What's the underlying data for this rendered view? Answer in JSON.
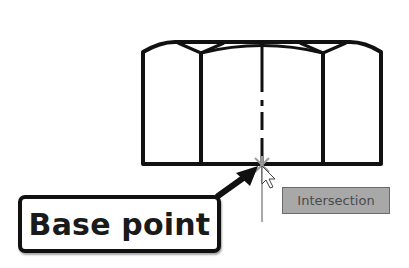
{
  "diagram": {
    "type": "cad-object-snap",
    "shape": "hex-nut-side-view",
    "callout": {
      "label": "Base point"
    },
    "snap_tooltip": {
      "label": "Intersection"
    },
    "colors": {
      "outline": "#111111",
      "snap_marker": "#9a9a9a",
      "tooltip_bg": "#a8a8a8",
      "tooltip_text": "#4a4a4a"
    }
  }
}
